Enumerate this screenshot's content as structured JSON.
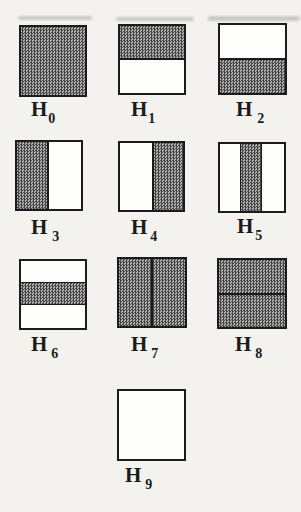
{
  "palette": {
    "paper": "#f3f2ef",
    "ink": "#1b1b1b",
    "hatch_dark": "#454545",
    "hatch_light": "#b2b2b2"
  },
  "hypotheses": [
    {
      "name": "H0",
      "label": "H",
      "subscript": "0",
      "pattern": "full-shaded",
      "x": 19,
      "y": 25,
      "w": 68,
      "h": 72,
      "label_x": 31,
      "label_y": 99,
      "sub_gap": 1
    },
    {
      "name": "H1",
      "label": "H",
      "subscript": "1",
      "pattern": "top-half-shaded",
      "x": 118,
      "y": 24,
      "w": 68,
      "h": 71,
      "label_x": 131,
      "label_y": 99,
      "sub_gap": 1
    },
    {
      "name": "H2",
      "label": "H",
      "subscript": "2",
      "pattern": "bottom-half-shaded",
      "x": 218,
      "y": 23,
      "w": 69,
      "h": 72,
      "label_x": 236,
      "label_y": 99,
      "sub_gap": 5
    },
    {
      "name": "H3",
      "label": "H",
      "subscript": "3",
      "pattern": "left-half-shaded",
      "x": 15,
      "y": 140,
      "w": 68,
      "h": 71,
      "label_x": 31,
      "label_y": 217,
      "sub_gap": 5
    },
    {
      "name": "H4",
      "label": "H",
      "subscript": "4",
      "pattern": "right-half-shaded",
      "x": 118,
      "y": 141,
      "w": 67,
      "h": 71,
      "label_x": 131,
      "label_y": 217,
      "sub_gap": 3
    },
    {
      "name": "H5",
      "label": "H",
      "subscript": "5",
      "pattern": "center-vertical-band",
      "x": 218,
      "y": 142,
      "w": 68,
      "h": 71,
      "label_x": 237,
      "label_y": 216,
      "sub_gap": 2
    },
    {
      "name": "H6",
      "label": "H",
      "subscript": "6",
      "pattern": "center-horizontal-band",
      "x": 19,
      "y": 259,
      "w": 68,
      "h": 71,
      "label_x": 31,
      "label_y": 334,
      "sub_gap": 4
    },
    {
      "name": "H7",
      "label": "H",
      "subscript": "7",
      "pattern": "shaded-vertical-split",
      "x": 117,
      "y": 257,
      "w": 70,
      "h": 71,
      "label_x": 131,
      "label_y": 334,
      "sub_gap": 4
    },
    {
      "name": "H8",
      "label": "H",
      "subscript": "8",
      "pattern": "shaded-horizontal-split",
      "x": 217,
      "y": 258,
      "w": 70,
      "h": 71,
      "label_x": 235,
      "label_y": 334,
      "sub_gap": 4
    },
    {
      "name": "H9",
      "label": "H",
      "subscript": "9",
      "pattern": "empty",
      "x": 117,
      "y": 389,
      "w": 69,
      "h": 72,
      "label_x": 125,
      "label_y": 465,
      "sub_gap": 4
    }
  ],
  "scan_artifacts": [
    {
      "x": 18,
      "y": 16,
      "w": 74,
      "h": 4
    },
    {
      "x": 116,
      "y": 17,
      "w": 78,
      "h": 4
    },
    {
      "x": 208,
      "y": 16,
      "w": 92,
      "h": 5
    }
  ]
}
